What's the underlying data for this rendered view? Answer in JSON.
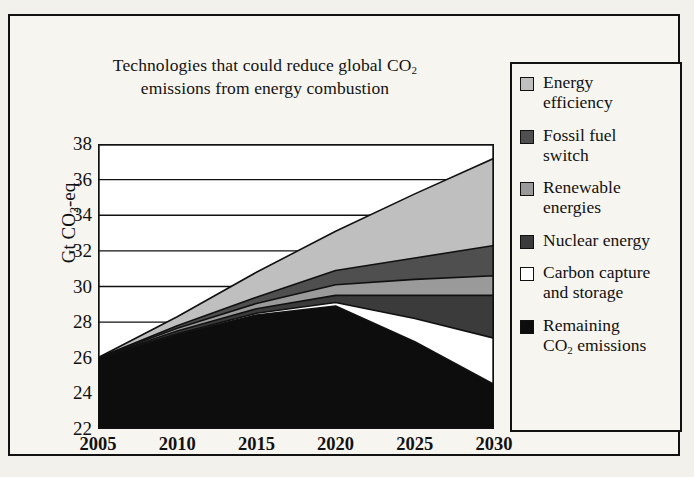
{
  "chart_data": {
    "type": "area",
    "title_line1": "Technologies that could reduce global CO",
    "title_sub1": "2",
    "title_line2": "emissions from energy combustion",
    "ylabel_pre": "Gt CO",
    "ylabel_sub": "2",
    "ylabel_post": "-eq",
    "xlabel": "",
    "x": [
      2005,
      2010,
      2015,
      2020,
      2025,
      2030
    ],
    "xticks": [
      "2005",
      "2010",
      "2015",
      "2020",
      "2025",
      "2030"
    ],
    "yticks": [
      "38",
      "36",
      "34",
      "32",
      "30",
      "28",
      "26",
      "24",
      "22"
    ],
    "ytickvals": [
      38,
      36,
      34,
      32,
      30,
      28,
      26,
      24,
      22
    ],
    "ylim": [
      22,
      38
    ],
    "xlim": [
      2005,
      2030
    ],
    "grid": true,
    "legend_position": "right-outside",
    "stack_order_bottom_to_top": [
      "Remaining CO2 emissions",
      "Carbon capture and storage",
      "Nuclear energy",
      "Renewable energies",
      "Fossil fuel switch",
      "Energy efficiency"
    ],
    "series": [
      {
        "name": "Remaining CO2 emissions",
        "color": "#0d0d0d",
        "cumulative_top": [
          26.0,
          27.3,
          28.4,
          28.9,
          26.9,
          24.5
        ]
      },
      {
        "name": "Carbon capture and storage",
        "color": "#ffffff",
        "cumulative_top": [
          26.0,
          27.35,
          28.5,
          29.1,
          28.2,
          27.1
        ]
      },
      {
        "name": "Nuclear energy",
        "color": "#3b3b3b",
        "cumulative_top": [
          26.0,
          27.5,
          28.75,
          29.5,
          29.5,
          29.5
        ]
      },
      {
        "name": "Renewable energies",
        "color": "#9a9a9a",
        "cumulative_top": [
          26.0,
          27.65,
          29.05,
          30.1,
          30.4,
          30.6
        ]
      },
      {
        "name": "Fossil fuel switch",
        "color": "#4f4f4f",
        "cumulative_top": [
          26.0,
          27.8,
          29.4,
          30.9,
          31.6,
          32.3
        ]
      },
      {
        "name": "Energy efficiency",
        "color": "#bfbfbf",
        "cumulative_top": [
          26.0,
          28.3,
          30.8,
          33.1,
          35.2,
          37.2
        ]
      }
    ]
  },
  "legend": {
    "items": [
      {
        "label": "Energy efficiency",
        "color": "#bfbfbf",
        "swatch": "legend-swatch-energy-efficiency"
      },
      {
        "label": "Fossil fuel switch",
        "color": "#4f4f4f",
        "swatch": "legend-swatch-fossil-fuel-switch"
      },
      {
        "label": "Renewable energies",
        "color": "#9a9a9a",
        "swatch": "legend-swatch-renewable-energies"
      },
      {
        "label": "Nuclear energy",
        "color": "#3b3b3b",
        "swatch": "legend-swatch-nuclear-energy"
      },
      {
        "label": "Carbon capture and storage",
        "color": "#ffffff",
        "swatch": "legend-swatch-carbon-capture"
      },
      {
        "label": "Remaining CO2 emissions",
        "color": "#0d0d0d",
        "swatch": "legend-swatch-remaining-co2"
      }
    ],
    "labels_rendered": [
      {
        "line1": "Energy",
        "line2": "efficiency",
        "sub": ""
      },
      {
        "line1": "Fossil fuel",
        "line2": "switch",
        "sub": ""
      },
      {
        "line1": "Renewable",
        "line2": "energies",
        "sub": ""
      },
      {
        "line1": "Nuclear energy",
        "line2": "",
        "sub": ""
      },
      {
        "line1": "Carbon capture",
        "line2": "and storage",
        "sub": ""
      },
      {
        "line1": "Remaining",
        "line2": "CO",
        "sub": "2",
        "line2_tail": " emissions"
      }
    ]
  }
}
